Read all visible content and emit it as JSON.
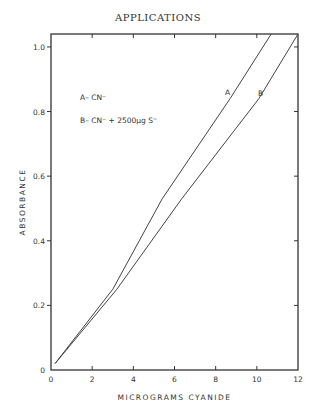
{
  "page": {
    "title": "APPLICATIONS"
  },
  "chart_data": {
    "type": "line",
    "title": "APPLICATIONS",
    "xlabel": "MICROGRAMS CYANIDE",
    "ylabel": "ABSORBANCE",
    "xlim": [
      0,
      12
    ],
    "ylim": [
      0,
      1.04
    ],
    "xticks": [
      0,
      2,
      4,
      6,
      8,
      10,
      12
    ],
    "xtick_labels": [
      "0",
      "2",
      "4",
      "6",
      "8",
      "10",
      "12"
    ],
    "yticks": [
      0,
      0.2,
      0.4,
      0.6,
      0.8,
      1.0
    ],
    "ytick_labels": [
      "0",
      "0.2",
      "0.4",
      "0.6",
      "0.8",
      "1.0"
    ],
    "grid": false,
    "legend": [
      {
        "key": "A",
        "text": "A–  CN⁻"
      },
      {
        "key": "B",
        "text": "B–  CN⁻ + 2500µg S⁼"
      }
    ],
    "legend_position": "upper left",
    "series": [
      {
        "name": "A",
        "label": "A",
        "x": [
          0.2,
          3.0,
          5.4,
          8.7,
          10.7
        ],
        "values": [
          0.02,
          0.25,
          0.53,
          0.84,
          1.04
        ]
      },
      {
        "name": "B",
        "label": "B",
        "x": [
          0.2,
          3.2,
          6.35,
          10.1,
          12.0
        ],
        "values": [
          0.02,
          0.25,
          0.53,
          0.84,
          1.04
        ]
      }
    ]
  }
}
